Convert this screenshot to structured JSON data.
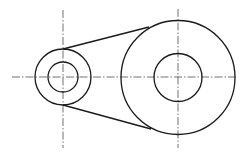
{
  "drawing": {
    "type": "belt-pulley-outline",
    "colors": {
      "background": "#ffffff",
      "outline": "#1a1a1a",
      "centerline": "#333333"
    },
    "small_pulley": {
      "cx": 63,
      "cy": 77,
      "outer_r": 28,
      "inner_r": 15
    },
    "large_pulley": {
      "cx": 178,
      "cy": 77.5,
      "outer_r": 57,
      "inner_r": 24
    },
    "tangent_lines": [
      {
        "x1": 63,
        "y1": 49,
        "x2": 149,
        "y2": 27
      },
      {
        "x1": 63,
        "y1": 105,
        "x2": 151,
        "y2": 129
      }
    ],
    "centerlines": {
      "horizontal": {
        "x1": 12,
        "y1": 77,
        "x2": 238,
        "y2": 77
      },
      "small_vertical": {
        "x1": 63,
        "y1": 10,
        "x2": 63,
        "y2": 148
      },
      "large_vertical": {
        "x1": 178,
        "y1": 9,
        "x2": 178,
        "y2": 148
      }
    }
  }
}
